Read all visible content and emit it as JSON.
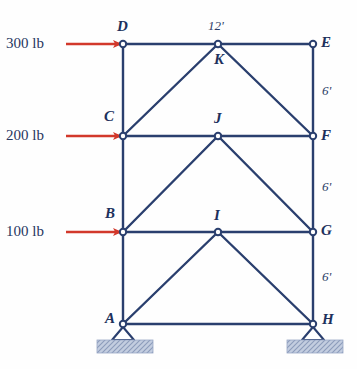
{
  "figure": {
    "colors": {
      "member": "#2a3f6e",
      "load_arrow": "#d2382b",
      "label": "#20305c",
      "ground_pad": "#b9c4da",
      "background": "#ffffff"
    }
  },
  "joints": [
    {
      "id": "A",
      "label": "A",
      "x": 123,
      "y": 324,
      "label_dx": -18,
      "label_dy": -13,
      "support": "pin"
    },
    {
      "id": "B",
      "label": "B",
      "x": 123,
      "y": 232,
      "label_dx": -18,
      "label_dy": -26,
      "support": "none"
    },
    {
      "id": "C",
      "label": "C",
      "x": 123,
      "y": 136,
      "label_dx": -19,
      "label_dy": -27,
      "support": "none"
    },
    {
      "id": "D",
      "label": "D",
      "x": 123,
      "y": 44,
      "label_dx": -6,
      "label_dy": -25,
      "support": "none"
    },
    {
      "id": "E",
      "label": "E",
      "x": 313,
      "y": 44,
      "label_dx": 8,
      "label_dy": -9,
      "support": "none"
    },
    {
      "id": "F",
      "label": "F",
      "x": 313,
      "y": 136,
      "label_dx": 8,
      "label_dy": -8,
      "support": "none"
    },
    {
      "id": "G",
      "label": "G",
      "x": 313,
      "y": 232,
      "label_dx": 8,
      "label_dy": -9,
      "support": "none"
    },
    {
      "id": "H",
      "label": "H",
      "x": 313,
      "y": 324,
      "label_dx": 9,
      "label_dy": -12,
      "support": "pin"
    },
    {
      "id": "I",
      "label": "I",
      "x": 218,
      "y": 232,
      "label_dx": -4,
      "label_dy": -24,
      "support": "none"
    },
    {
      "id": "J",
      "label": "J",
      "x": 218,
      "y": 136,
      "label_dx": -4,
      "label_dy": -25,
      "support": "none"
    },
    {
      "id": "K",
      "label": "K",
      "x": 218,
      "y": 44,
      "label_dx": -4,
      "label_dy": 8,
      "support": "none"
    }
  ],
  "members": [
    {
      "from": "A",
      "to": "B"
    },
    {
      "from": "B",
      "to": "C"
    },
    {
      "from": "C",
      "to": "D"
    },
    {
      "from": "D",
      "to": "K"
    },
    {
      "from": "K",
      "to": "E"
    },
    {
      "from": "E",
      "to": "F"
    },
    {
      "from": "F",
      "to": "G"
    },
    {
      "from": "G",
      "to": "H"
    },
    {
      "from": "A",
      "to": "H"
    },
    {
      "from": "B",
      "to": "I"
    },
    {
      "from": "I",
      "to": "G"
    },
    {
      "from": "C",
      "to": "J"
    },
    {
      "from": "J",
      "to": "F"
    },
    {
      "from": "A",
      "to": "I"
    },
    {
      "from": "B",
      "to": "J"
    },
    {
      "from": "C",
      "to": "K"
    },
    {
      "from": "I",
      "to": "H"
    },
    {
      "from": "J",
      "to": "G"
    },
    {
      "from": "K",
      "to": "F"
    }
  ],
  "loads": [
    {
      "id": "load-300",
      "text": "300 lb",
      "target": "D",
      "text_x": 6,
      "text_y": 36,
      "arrow_x1": 66,
      "arrow_x2": 121,
      "arrow_y": 44
    },
    {
      "id": "load-200",
      "text": "200 lb",
      "target": "C",
      "text_x": 6,
      "text_y": 128,
      "arrow_x1": 66,
      "arrow_x2": 121,
      "arrow_y": 136
    },
    {
      "id": "load-100",
      "text": "100 lb",
      "target": "B",
      "text_x": 6,
      "text_y": 224,
      "arrow_x1": 66,
      "arrow_x2": 121,
      "arrow_y": 232
    }
  ],
  "dimensions": [
    {
      "id": "dim-span",
      "text": "12'",
      "x": 208,
      "y": 19
    },
    {
      "id": "dim-right-top",
      "text": "6'",
      "x": 322,
      "y": 84
    },
    {
      "id": "dim-right-mid",
      "text": "6'",
      "x": 322,
      "y": 180
    },
    {
      "id": "dim-right-bot",
      "text": "6'",
      "x": 322,
      "y": 270
    }
  ],
  "supports": [
    {
      "id": "support-A",
      "joint": "A",
      "pad_x": 97,
      "pad_y": 340,
      "pad_w": 56,
      "pad_h": 13
    },
    {
      "id": "support-H",
      "joint": "H",
      "pad_x": 287,
      "pad_y": 340,
      "pad_w": 56,
      "pad_h": 13
    }
  ]
}
